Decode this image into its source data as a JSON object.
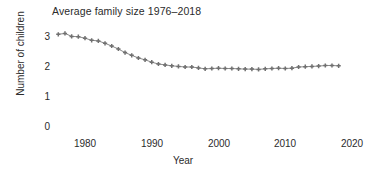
{
  "chart_data": {
    "type": "line",
    "title": "Average family size 1976–2018",
    "xlabel": "Year",
    "ylabel": "Number of children",
    "grid": false,
    "legend": "none",
    "marker": "plus-marker",
    "line_color": "#8a8a8a",
    "marker_color": "#707070",
    "text_color": "#2b2b2b",
    "xlim": [
      1975,
      2021
    ],
    "ylim": [
      0,
      3.35
    ],
    "xticks": [
      1980,
      1990,
      2000,
      2010,
      2020
    ],
    "xtick_labels": [
      "1980",
      "1990",
      "2000",
      "2010",
      "2020"
    ],
    "yticks": [
      0,
      1,
      2,
      3
    ],
    "ytick_labels": [
      "0",
      "1",
      "2",
      "3"
    ],
    "x": [
      1976,
      1977,
      1978,
      1979,
      1980,
      1981,
      1982,
      1983,
      1984,
      1985,
      1986,
      1987,
      1988,
      1989,
      1990,
      1991,
      1992,
      1993,
      1994,
      1995,
      1996,
      1997,
      1998,
      1999,
      2000,
      2001,
      2002,
      2003,
      2004,
      2005,
      2006,
      2007,
      2008,
      2009,
      2010,
      2011,
      2012,
      2013,
      2014,
      2015,
      2016,
      2017,
      2018
    ],
    "values": [
      3.09,
      3.12,
      3.02,
      3.01,
      2.96,
      2.89,
      2.87,
      2.79,
      2.7,
      2.6,
      2.48,
      2.39,
      2.3,
      2.24,
      2.16,
      2.1,
      2.07,
      2.04,
      2.02,
      2.0,
      2.0,
      1.97,
      1.94,
      1.95,
      1.96,
      1.95,
      1.95,
      1.94,
      1.93,
      1.93,
      1.92,
      1.94,
      1.95,
      1.96,
      1.95,
      1.96,
      2.0,
      2.01,
      2.02,
      2.03,
      2.05,
      2.05,
      2.04
    ],
    "series_name": "Average family size"
  }
}
